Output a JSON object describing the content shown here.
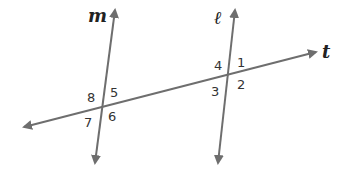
{
  "diagram": {
    "lines": [
      {
        "name": "m",
        "label": "m",
        "x1": 95,
        "y1": 163,
        "x2": 115,
        "y2": 10
      },
      {
        "name": "l",
        "label": "ℓ",
        "x1": 218,
        "y1": 163,
        "x2": 235,
        "y2": 10
      },
      {
        "name": "t",
        "label": "t",
        "x1": 24,
        "y1": 127,
        "x2": 316,
        "y2": 52
      }
    ],
    "line_color": "#6e6e6e",
    "angle_labels": [
      {
        "text": "1",
        "x": 237,
        "y": 67
      },
      {
        "text": "2",
        "x": 237,
        "y": 89
      },
      {
        "text": "3",
        "x": 211,
        "y": 96
      },
      {
        "text": "4",
        "x": 214,
        "y": 70
      },
      {
        "text": "5",
        "x": 110,
        "y": 97
      },
      {
        "text": "6",
        "x": 108,
        "y": 121
      },
      {
        "text": "7",
        "x": 84,
        "y": 127
      },
      {
        "text": "8",
        "x": 87,
        "y": 102
      }
    ]
  }
}
